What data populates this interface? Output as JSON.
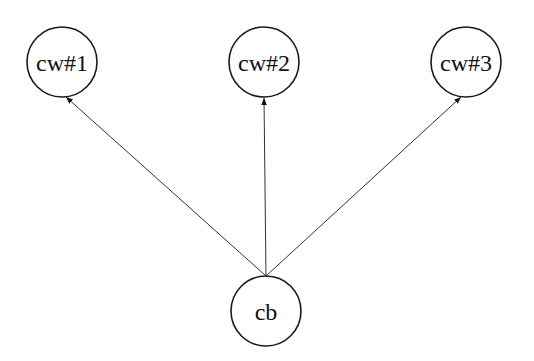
{
  "diagram": {
    "type": "tree",
    "nodes": [
      {
        "id": "cw1",
        "label": "cw#1",
        "cx": 62,
        "cy": 62,
        "r": 35
      },
      {
        "id": "cw2",
        "label": "cw#2",
        "cx": 264,
        "cy": 62,
        "r": 35
      },
      {
        "id": "cw3",
        "label": "cw#3",
        "cx": 466,
        "cy": 62,
        "r": 35
      },
      {
        "id": "cb",
        "label": "cb",
        "cx": 266,
        "cy": 311,
        "r": 35
      }
    ],
    "edges": [
      {
        "from": "cb",
        "to": "cw1",
        "directed": true
      },
      {
        "from": "cb",
        "to": "cw2",
        "directed": true
      },
      {
        "from": "cb",
        "to": "cw3",
        "directed": true
      }
    ]
  }
}
